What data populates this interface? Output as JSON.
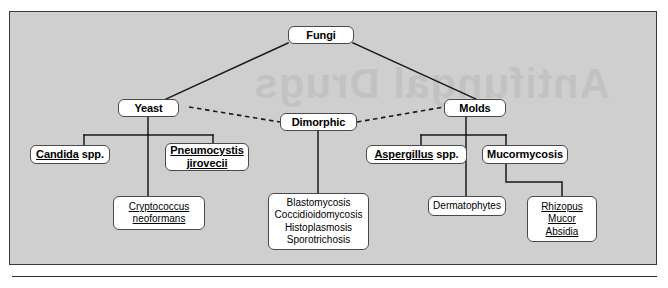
{
  "figure": {
    "type": "hierarchy-tree",
    "bleed_artifact_text": "Antifungal Drugs",
    "colors": {
      "panel_background": "#cfcfcf",
      "panel_border": "#3a3a3a",
      "node_fill": "#ffffff",
      "node_border": "#4a4a4a",
      "connector": "#1a1a1a",
      "page_background": "#ffffff"
    },
    "legend": {
      "solid_line_meaning": "direct classification / parent-child",
      "dashed_line_meaning": "dimorphic relationship between yeast and mold forms"
    }
  },
  "nodes": {
    "fungi": {
      "label": "Fungi",
      "style": "bold"
    },
    "yeast": {
      "label": "Yeast",
      "style": "bold"
    },
    "dimorphic": {
      "label": "Dimorphic",
      "style": "bold"
    },
    "molds": {
      "label": "Molds",
      "style": "bold"
    },
    "candida": {
      "line1": "Candida",
      "line2": "spp.",
      "style": "bold",
      "underline": "genus-only"
    },
    "pneumocystis": {
      "line1": "Pneumocystis",
      "line2": "jirovecii",
      "style": "bold",
      "underline": "both"
    },
    "aspergillus": {
      "line1": "Aspergillus",
      "line2": "spp.",
      "style": "bold",
      "underline": "genus-only"
    },
    "mucormycosis": {
      "label": "Mucormycosis",
      "style": "bold"
    },
    "cryptococcus": {
      "lines": [
        "Cryptococcus",
        "neoformans"
      ],
      "style": "plain",
      "underline": "all"
    },
    "dermatophytes": {
      "lines": [
        "Dermatophytes"
      ],
      "style": "plain",
      "underline": "none"
    },
    "dimorphic_diseases": {
      "lines": [
        "Blastomycosis",
        "Coccidioidomycosis",
        "Histoplasmosis",
        "Sporotrichosis"
      ],
      "style": "plain",
      "underline": "none"
    },
    "mucor_genera": {
      "lines": [
        "Rhizopus",
        "Mucor",
        "Absidia"
      ],
      "style": "plain",
      "underline": "all"
    }
  },
  "edges": [
    {
      "from": "fungi",
      "to": "yeast",
      "line": "solid"
    },
    {
      "from": "fungi",
      "to": "molds",
      "line": "solid"
    },
    {
      "from": "yeast",
      "to": "dimorphic",
      "line": "dashed"
    },
    {
      "from": "dimorphic",
      "to": "molds",
      "line": "dashed"
    },
    {
      "from": "yeast",
      "to": "candida",
      "line": "solid"
    },
    {
      "from": "yeast",
      "to": "pneumocystis",
      "line": "solid"
    },
    {
      "from": "yeast",
      "to": "cryptococcus",
      "line": "solid"
    },
    {
      "from": "dimorphic",
      "to": "dimorphic_diseases",
      "line": "solid"
    },
    {
      "from": "molds",
      "to": "aspergillus",
      "line": "solid"
    },
    {
      "from": "molds",
      "to": "mucormycosis",
      "line": "solid"
    },
    {
      "from": "molds",
      "to": "dermatophytes",
      "line": "solid"
    },
    {
      "from": "mucormycosis",
      "to": "mucor_genera",
      "line": "solid"
    }
  ]
}
